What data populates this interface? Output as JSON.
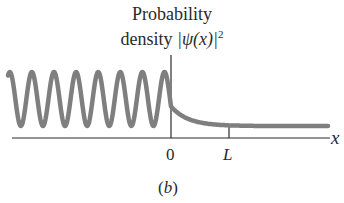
{
  "figure": {
    "title_line1": "Probability",
    "title_line2_prefix": "density ",
    "title_line2_psi": "|ψ(x)|",
    "title_line2_sup": "2",
    "x_axis_label": "x",
    "tick_zero": "0",
    "tick_L": "L",
    "panel_label": "(b)"
  },
  "colors": {
    "curve": "#7f7f7f",
    "axes": "#2a2a2a"
  },
  "chart_data": {
    "type": "line",
    "xlabel": "x",
    "ylabel": "|ψ(x)|²",
    "x_ticks": [
      "0",
      "L"
    ],
    "regions": [
      {
        "name": "x<0",
        "shape": "sinusoidal oscillation",
        "peaks": 8,
        "min_value": "≈0",
        "max_value": "high"
      },
      {
        "name": "0<x<L",
        "shape": "exponential decay",
        "from": "oscillation value at 0",
        "to": "constant level"
      },
      {
        "name": "x>L",
        "shape": "constant (flat)",
        "value": "small nonzero"
      }
    ],
    "grid": false,
    "legend": null
  }
}
